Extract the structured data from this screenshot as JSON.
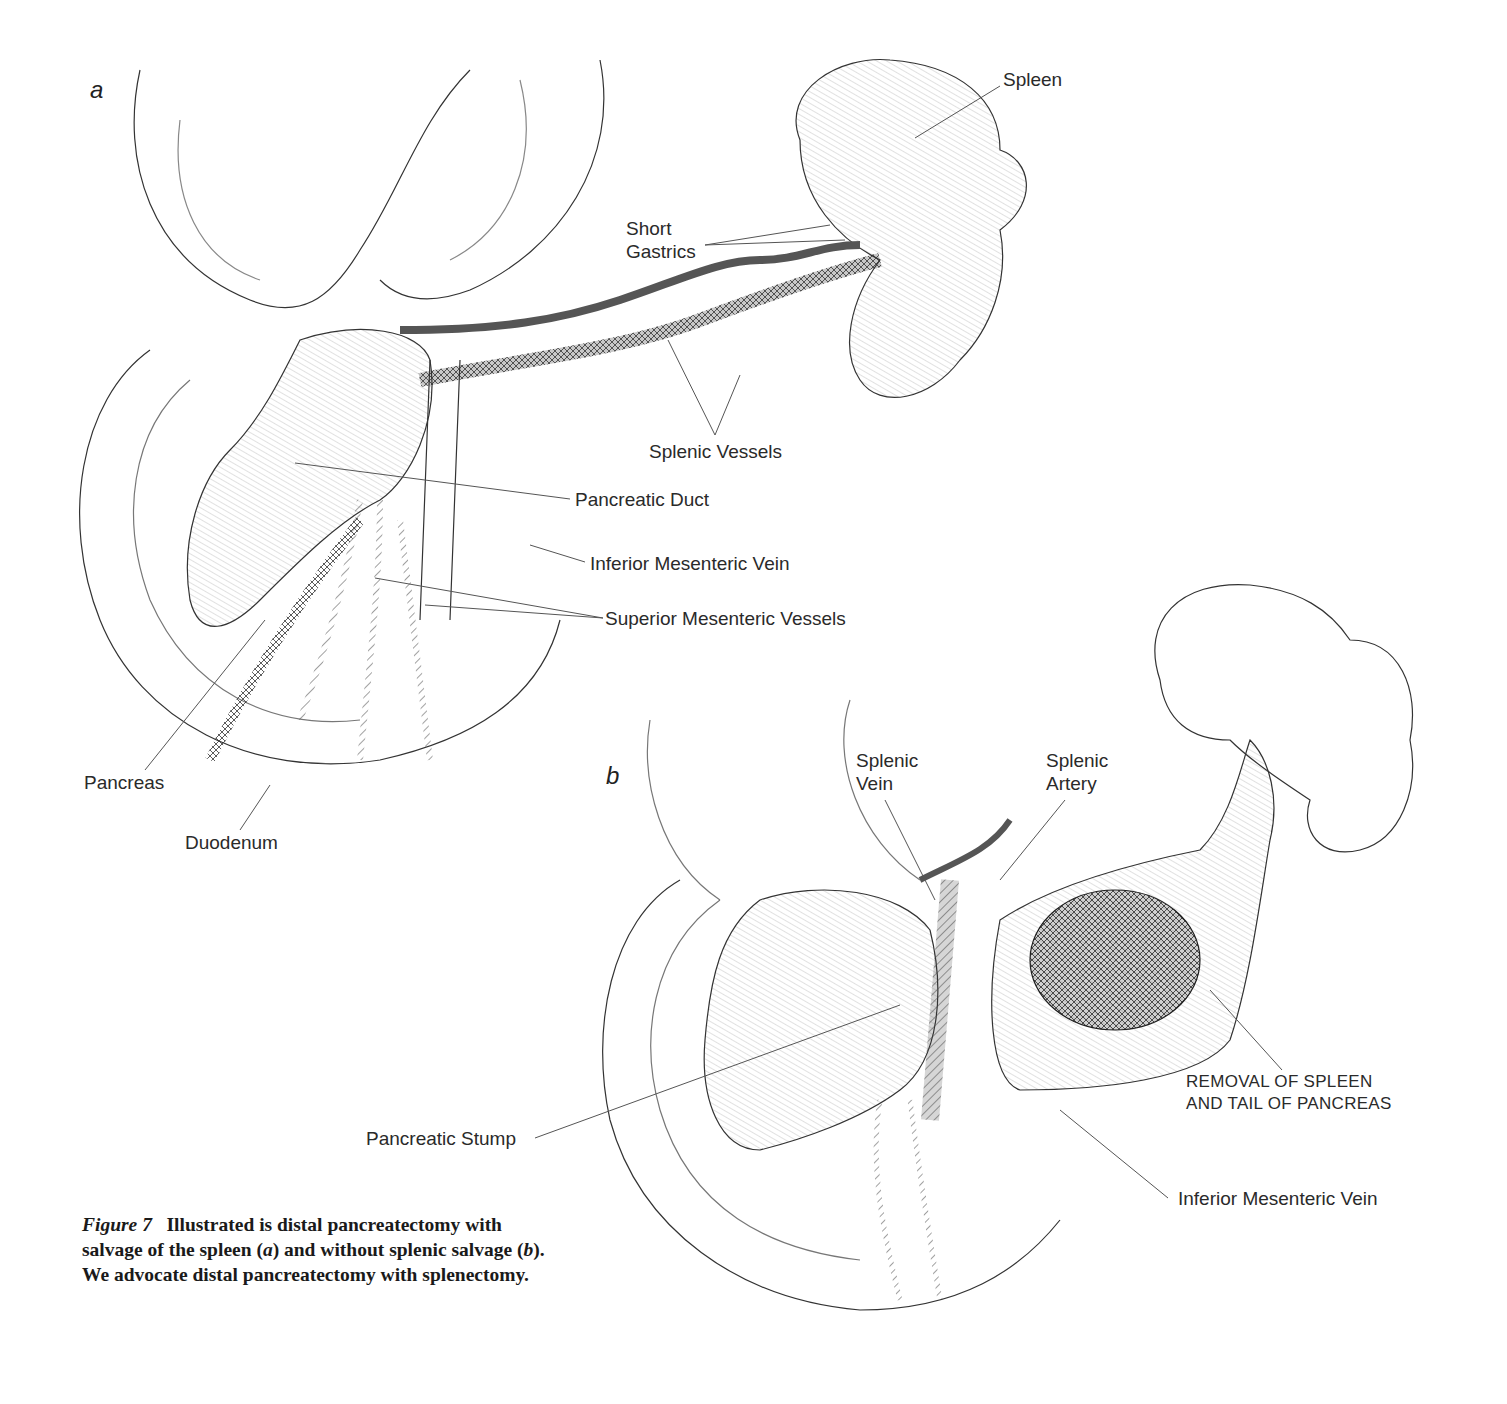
{
  "figure": {
    "panels": {
      "a": "a",
      "b": "b"
    },
    "labels_a": {
      "spleen": "Spleen",
      "short_gastrics_1": "Short",
      "short_gastrics_2": "Gastrics",
      "splenic_vessels": "Splenic Vessels",
      "pancreatic_duct": "Pancreatic Duct",
      "inferior_mesenteric_vein": "Inferior Mesenteric Vein",
      "superior_mesenteric_vessels": "Superior Mesenteric Vessels",
      "pancreas": "Pancreas",
      "duodenum": "Duodenum"
    },
    "labels_b": {
      "splenic_vein_1": "Splenic",
      "splenic_vein_2": "Vein",
      "splenic_artery_1": "Splenic",
      "splenic_artery_2": "Artery",
      "removal_1": "REMOVAL OF SPLEEN",
      "removal_2": "AND TAIL OF PANCREAS",
      "pancreatic_stump": "Pancreatic Stump",
      "inferior_mesenteric_vein": "Inferior Mesenteric Vein"
    },
    "caption": {
      "figure_label": "Figure 7",
      "text_1": "Illustrated is distal pancreatectomy with salvage of the spleen (",
      "a": "a",
      "text_2": ") and without splenic salvage (",
      "b": "b",
      "text_3": "). We advocate distal pancreatectomy with splenectomy."
    }
  }
}
